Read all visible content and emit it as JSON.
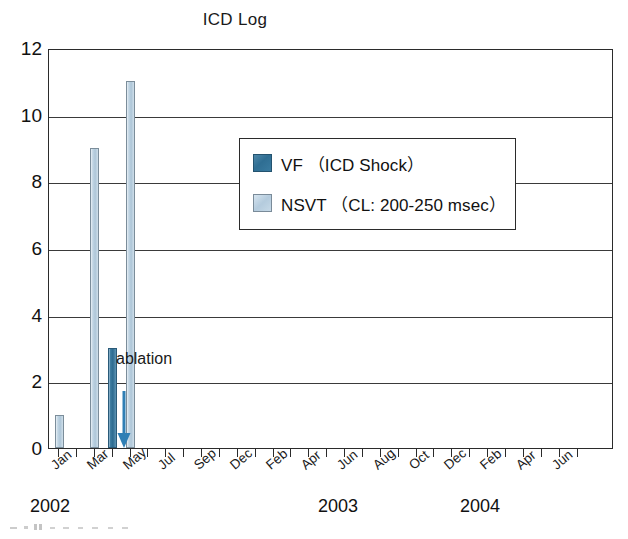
{
  "chart_data": {
    "type": "bar",
    "title": "ICD Log",
    "xlabel": "",
    "ylabel": "",
    "ylim": [
      0,
      12
    ],
    "yticks": [
      0,
      2,
      4,
      6,
      8,
      10,
      12
    ],
    "grid": true,
    "legend_position": "inside-upper-center",
    "categories": [
      "Jan",
      "Feb",
      "Mar",
      "Apr",
      "May",
      "Jun",
      "Jul",
      "Aug",
      "Sep",
      "Oct",
      "Nov",
      "Dec",
      "Jan",
      "Feb",
      "Mar",
      "Apr",
      "May",
      "Jun",
      "Jul",
      "Aug",
      "Sep",
      "Oct",
      "Nov",
      "Dec",
      "Jan",
      "Feb",
      "Mar",
      "Apr",
      "May",
      "Jun"
    ],
    "tick_labels": [
      "Jan",
      "Mar",
      "May",
      "Jul",
      "Sep",
      "Dec",
      "Feb",
      "Apr",
      "Jun",
      "Aug",
      "Oct",
      "Dec",
      "Feb",
      "Apr",
      "Jun"
    ],
    "year_labels": [
      {
        "text": "2002",
        "left_px": 30
      },
      {
        "text": "2003",
        "left_px": 318
      },
      {
        "text": "2004",
        "left_px": 460
      }
    ],
    "series": [
      {
        "name": "VF (ICD Shock)",
        "color": "#2f6e93",
        "points": [
          {
            "x_index": 3,
            "value": 3
          }
        ]
      },
      {
        "name": "NSVT (CL: 200-250 msec)",
        "color": "#b4cbdd",
        "points": [
          {
            "x_index": 0,
            "value": 1
          },
          {
            "x_index": 2,
            "value": 9
          },
          {
            "x_index": 4,
            "value": 11
          }
        ]
      }
    ],
    "annotations": [
      {
        "text": "ablation",
        "x_index": 5,
        "y_value": 2.3,
        "arrow_to_y": 0
      }
    ]
  },
  "chart": {
    "title": "ICD Log",
    "y_ticks": [
      "0",
      "2",
      "4",
      "6",
      "8",
      "10",
      "12"
    ],
    "x_tick_labels": [
      "Jan",
      "Mar",
      "May",
      "Jul",
      "Sep",
      "Dec",
      "Feb",
      "Apr",
      "Jun",
      "Aug",
      "Oct",
      "Dec",
      "Feb",
      "Apr",
      "Jun"
    ],
    "years": [
      "2002",
      "2003",
      "2004"
    ],
    "annotation_label": "ablation",
    "colors": {
      "vf_bar": "#2f6e93",
      "nsvt_bar": "#b4cbdd",
      "arrow": "#2f7fb5",
      "axis": "#2b2b2b",
      "background": "#ffffff"
    }
  },
  "legend": {
    "items": [
      {
        "label": "VF （ICD Shock）",
        "series_key": "vf"
      },
      {
        "label": "NSVT （CL: 200-250 msec）",
        "series_key": "nsvt"
      }
    ]
  }
}
